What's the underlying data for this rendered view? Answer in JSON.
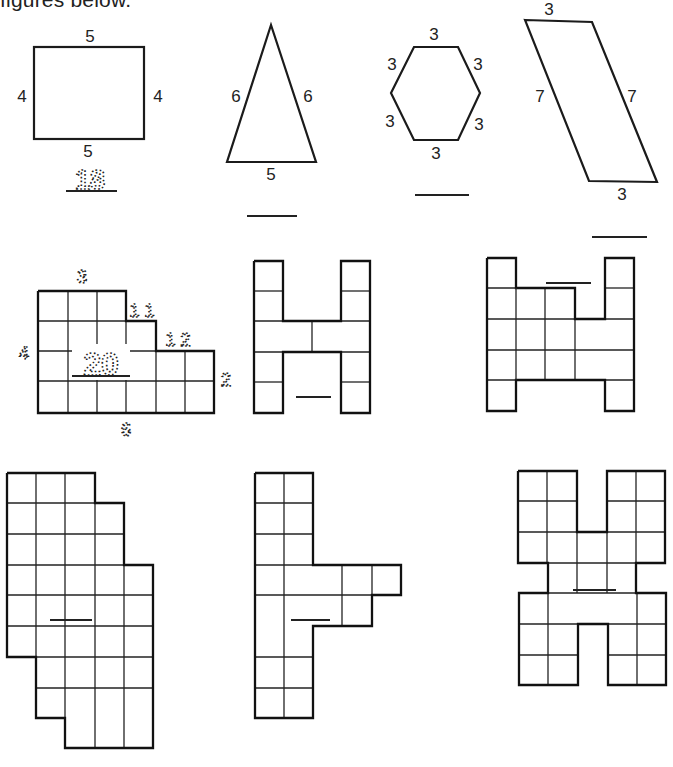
{
  "header": {
    "text": "figures below."
  },
  "figures": [
    {
      "id": "rectangle",
      "type": "rectangle",
      "side_labels": {
        "top": "5",
        "left": "4",
        "right": "4",
        "bottom": "5"
      },
      "answer": "18",
      "answer_style": "dotted-trace"
    },
    {
      "id": "triangle",
      "type": "isosceles-triangle",
      "side_labels": {
        "left": "6",
        "right": "6",
        "bottom": "5"
      },
      "answer": ""
    },
    {
      "id": "hexagon",
      "type": "regular-hexagon",
      "side_labels": {
        "top": "3",
        "upper_left": "3",
        "upper_right": "3",
        "lower_left": "3",
        "lower_right": "3",
        "bottom": "3"
      },
      "answer": ""
    },
    {
      "id": "parallelogram",
      "type": "parallelogram",
      "side_labels": {
        "top": "3",
        "left": "7",
        "right": "7",
        "bottom": "3"
      },
      "answer": ""
    },
    {
      "id": "staircase-grid",
      "type": "grid-figure",
      "side_labels": {
        "top": "3",
        "step1": "1 1",
        "step2": "1 2",
        "left": "4",
        "right": "2",
        "bottom": "6"
      },
      "label_style": "dotted-trace",
      "answer": "20",
      "answer_style": "dotted-trace"
    },
    {
      "id": "h-grid-small",
      "type": "grid-figure",
      "answer": ""
    },
    {
      "id": "h-grid-wide",
      "type": "grid-figure",
      "answer": ""
    },
    {
      "id": "stepped-grid-tall",
      "type": "grid-figure",
      "answer": ""
    },
    {
      "id": "flag-grid",
      "type": "grid-figure",
      "answer": ""
    },
    {
      "id": "x-grid",
      "type": "grid-figure",
      "answer": ""
    }
  ]
}
